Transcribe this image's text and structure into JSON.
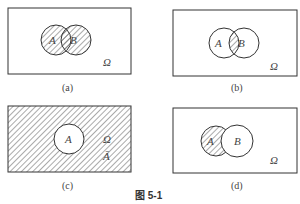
{
  "figure_caption": "图 5-1",
  "panels": [
    {
      "id": "a",
      "caption": "(a)",
      "universe_label": "Ω",
      "circle_labels": [
        "A",
        "B"
      ],
      "shaded": "A ∪ B"
    },
    {
      "id": "b",
      "caption": "(b)",
      "universe_label": "Ω",
      "circle_labels": [
        "A",
        "B"
      ],
      "shaded": "A ∩ B"
    },
    {
      "id": "c",
      "caption": "(c)",
      "universe_label": "Ω",
      "complement_label": "Ā",
      "circle_labels": [
        "A"
      ],
      "shaded": "complement of A"
    },
    {
      "id": "d",
      "caption": "(d)",
      "universe_label": "Ω",
      "circle_labels": [
        "A",
        "B"
      ],
      "shaded": "A − B"
    }
  ],
  "colors": {
    "stroke": "#333333",
    "hatch": "#555555",
    "background": "#ffffff"
  }
}
